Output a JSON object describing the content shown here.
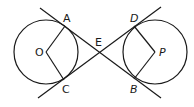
{
  "diagram": {
    "type": "geometry",
    "stroke_color": "#1a1a1a",
    "background": "#ffffff",
    "circles": [
      {
        "name": "O",
        "cx": 46,
        "cy": 52,
        "r": 32
      },
      {
        "name": "P",
        "cx": 155,
        "cy": 52,
        "r": 32
      }
    ],
    "points": {
      "A": {
        "label": "A",
        "x": 65,
        "y": 26
      },
      "C": {
        "label": "C",
        "x": 64,
        "y": 80
      },
      "O": {
        "label": "O",
        "x": 46,
        "y": 52
      },
      "E": {
        "label": "E",
        "x": 99,
        "y": 52
      },
      "D": {
        "label": "D",
        "x": 134,
        "y": 26
      },
      "B": {
        "label": "B",
        "x": 134,
        "y": 79
      },
      "P": {
        "label": "P",
        "x": 155,
        "y": 52
      }
    },
    "lines": [
      {
        "name": "tangent-AB",
        "from": [
          40,
          8
        ],
        "to": [
          161,
          98
        ]
      },
      {
        "name": "tangent-CD",
        "from": [
          38,
          98
        ],
        "to": [
          161,
          7
        ]
      }
    ],
    "segments": [
      "OA",
      "OC",
      "PD",
      "PB"
    ]
  }
}
